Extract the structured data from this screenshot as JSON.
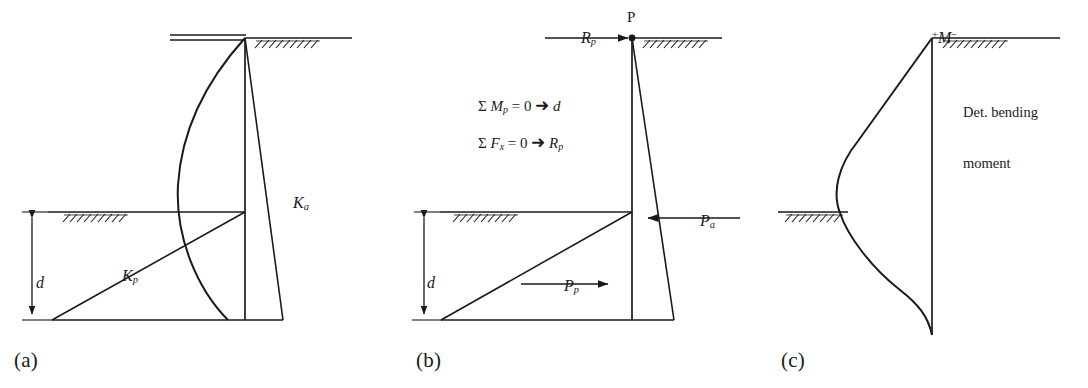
{
  "figure": {
    "stroke_color": "#1a1a1a",
    "background": "#ffffff"
  },
  "panels": [
    {
      "id": "a",
      "label": "(a)",
      "caption": "Net pressure distribution",
      "annotations": {
        "active_coefficient": "K",
        "active_sub": "a",
        "passive_coefficient": "K",
        "passive_sub": "p",
        "depth": "d"
      }
    },
    {
      "id": "b",
      "label": "(b)",
      "caption": "Force equilibrium",
      "annotations": {
        "anchor_point": "P",
        "anchor_reaction": "R",
        "anchor_reaction_sub": "p",
        "active_force": "P",
        "active_force_sub": "a",
        "passive_force": "P",
        "passive_force_sub": "p",
        "depth": "d"
      },
      "equations": [
        {
          "sum": "Σ",
          "term": "M",
          "term_sub": "p",
          "rhs": "0",
          "arrow": "➜",
          "result": "d"
        },
        {
          "sum": "Σ",
          "term": "F",
          "term_sub": "x",
          "rhs": "0",
          "arrow": "➜",
          "result": "R",
          "result_sub": "p"
        }
      ]
    },
    {
      "id": "c",
      "label": "(c)",
      "caption": "Bending moment diagram",
      "annotations": {
        "moment_sign_positive": "+",
        "moment_symbol": "M",
        "moment_sign_negative": "−",
        "note_line_1": "Det. bending",
        "note_line_2": "moment"
      }
    }
  ]
}
